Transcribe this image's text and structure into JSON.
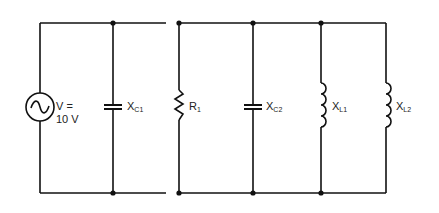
{
  "diagram": {
    "type": "parallel AC circuit",
    "source": {
      "label": "V =",
      "value": "10 V"
    },
    "components": [
      {
        "id": "C1",
        "kind": "capacitor",
        "label": "X",
        "sub": "C1"
      },
      {
        "id": "R1",
        "kind": "resistor",
        "label": "R",
        "sub": "1"
      },
      {
        "id": "C2",
        "kind": "capacitor",
        "label": "X",
        "sub": "C2"
      },
      {
        "id": "L1",
        "kind": "inductor",
        "label": "X",
        "sub": "L1"
      },
      {
        "id": "L2",
        "kind": "inductor",
        "label": "X",
        "sub": "L2"
      }
    ]
  }
}
